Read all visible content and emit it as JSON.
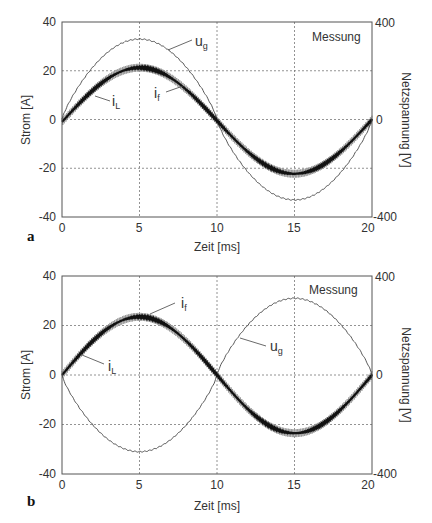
{
  "chart_data": [
    {
      "panel": "a",
      "type": "line",
      "title": "",
      "annotation": "Messung",
      "xlabel": "Zeit [ms]",
      "ylabel": "Strom [A]",
      "ylabel_right": "Netzspannung [V]",
      "xlim": [
        0,
        20
      ],
      "ylim": [
        -40,
        40
      ],
      "ylim_right": [
        -400,
        400
      ],
      "xticks": [
        "0",
        "5",
        "10",
        "15",
        "20"
      ],
      "yticks": [
        "40",
        "20",
        "0",
        "-20",
        "-40"
      ],
      "yticks_right": [
        "400",
        "0",
        "-400"
      ],
      "grid": true,
      "series": [
        {
          "name": "u_g",
          "label_main": "u",
          "label_sub": "g",
          "axis": "right",
          "style": "thin",
          "x": [
            0,
            2.5,
            5,
            7.5,
            10,
            12.5,
            15,
            17.5,
            20
          ],
          "values": [
            0,
            230,
            330,
            230,
            0,
            -230,
            -330,
            -230,
            0
          ]
        },
        {
          "name": "i_L",
          "label_main": "i",
          "label_sub": "L",
          "axis": "left",
          "style": "thick",
          "x": [
            0,
            2.5,
            5,
            7.5,
            10,
            12.5,
            15,
            17.5,
            20
          ],
          "values": [
            -2,
            14,
            22,
            15.5,
            0,
            -15.5,
            -22,
            -15,
            0
          ]
        },
        {
          "name": "i_f",
          "label_main": "i",
          "label_sub": "f",
          "axis": "left",
          "style": "ripple",
          "x": [
            0,
            2.5,
            5,
            7.5,
            10,
            12.5,
            15,
            17.5,
            20
          ],
          "values": [
            -2,
            14,
            22,
            15.5,
            0,
            -15.5,
            -22,
            -15,
            0
          ]
        }
      ]
    },
    {
      "panel": "b",
      "type": "line",
      "title": "",
      "annotation": "Messung",
      "xlabel": "Zeit [ms]",
      "ylabel": "Strom [A]",
      "ylabel_right": "Netzspannung [V]",
      "xlim": [
        0,
        20
      ],
      "ylim": [
        -40,
        40
      ],
      "ylim_right": [
        -400,
        400
      ],
      "xticks": [
        "0",
        "5",
        "10",
        "15",
        "20"
      ],
      "yticks": [
        "40",
        "20",
        "0",
        "-20",
        "-40"
      ],
      "yticks_right": [
        "400",
        "0",
        "-400"
      ],
      "grid": true,
      "series": [
        {
          "name": "u_g",
          "label_main": "u",
          "label_sub": "g",
          "axis": "right",
          "style": "thin",
          "x": [
            0,
            2.5,
            5,
            7.5,
            10,
            12.5,
            15,
            17.5,
            20
          ],
          "values": [
            0,
            -220,
            -310,
            -220,
            0,
            220,
            315,
            220,
            0
          ]
        },
        {
          "name": "i_L",
          "label_main": "i",
          "label_sub": "L",
          "axis": "left",
          "style": "thick",
          "x": [
            0,
            2.5,
            5,
            7.5,
            10,
            12.5,
            15,
            17.5,
            20
          ],
          "values": [
            0,
            16.5,
            23.5,
            16.5,
            0,
            -16.5,
            -23.5,
            -16.5,
            0
          ]
        },
        {
          "name": "i_f",
          "label_main": "i",
          "label_sub": "f",
          "axis": "left",
          "style": "ripple",
          "x": [
            0,
            2.5,
            5,
            7.5,
            10,
            12.5,
            15,
            17.5,
            20
          ],
          "values": [
            0,
            16.5,
            23.5,
            16.5,
            0,
            -16.5,
            -23.5,
            -16.5,
            0
          ]
        }
      ]
    }
  ],
  "colors": {
    "axis": "#555555",
    "grid": "#777777",
    "i_L": "#111111",
    "i_f": "#9a9a9a",
    "u_g": "#444444"
  }
}
